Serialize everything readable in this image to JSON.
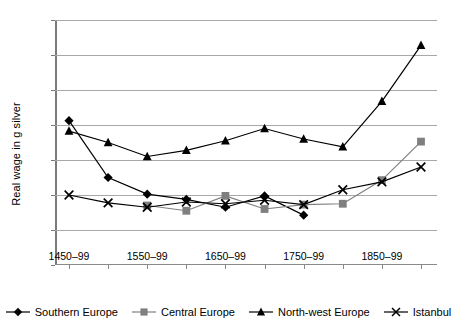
{
  "chart_data": {
    "type": "line",
    "title": "",
    "xlabel": "",
    "ylabel": "Real wage in g silver",
    "ylim": [
      0,
      14
    ],
    "ytick_step": 2,
    "yticks": [
      0,
      2,
      4,
      6,
      8,
      10,
      12,
      14
    ],
    "grid": true,
    "legend_position": "bottom",
    "categories": [
      "1450–99",
      "1500–49",
      "1550–99",
      "1600–49",
      "1650–99",
      "1700–49",
      "1750–99",
      "1800–49",
      "1850–99",
      "1900–13"
    ],
    "xtick_labels_shown": [
      "1450–99",
      "1550–99",
      "1650–99",
      "1750–99",
      "1850–99"
    ],
    "series": [
      {
        "name": "Southern Europe",
        "marker": "diamond",
        "color": "#000000",
        "values": [
          8.25,
          5.0,
          4.05,
          3.75,
          3.3,
          3.95,
          2.85,
          null,
          null,
          null
        ]
      },
      {
        "name": "Central Europe",
        "marker": "square",
        "color": "#7f7f7f",
        "values": [
          null,
          null,
          3.4,
          3.1,
          3.95,
          3.2,
          3.45,
          3.5,
          4.85,
          7.05
        ]
      },
      {
        "name": "North-west Europe",
        "marker": "triangle",
        "color": "#000000",
        "values": [
          7.65,
          7.0,
          6.2,
          6.55,
          7.1,
          7.8,
          7.2,
          6.75,
          9.35,
          12.55
        ]
      },
      {
        "name": "Istanbul",
        "marker": "cross",
        "color": "#000000",
        "values": [
          4.0,
          3.55,
          3.3,
          3.6,
          3.5,
          3.7,
          3.45,
          4.3,
          4.75,
          5.6
        ]
      }
    ]
  },
  "legend": {
    "items": [
      {
        "label": "Southern Europe"
      },
      {
        "label": "Central Europe"
      },
      {
        "label": "North-west Europe"
      },
      {
        "label": "Istanbul"
      }
    ]
  }
}
